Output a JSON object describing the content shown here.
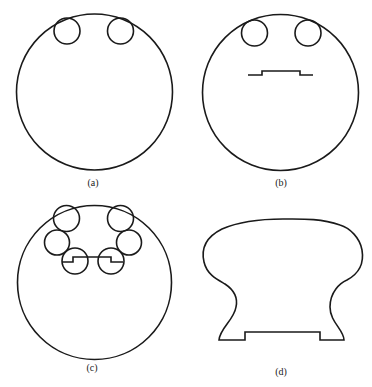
{
  "figure": {
    "panels": [
      {
        "id": "a",
        "label": "(a)",
        "description": "Large circle with two small circles inscribed at top"
      },
      {
        "id": "b",
        "label": "(b)",
        "description": "Large circle with two small circles at top and a stepped line segment below them"
      },
      {
        "id": "c",
        "label": "(c)",
        "description": "Large circle with six small circles arranged in a U shape connected by a stepped line"
      },
      {
        "id": "d",
        "label": "(d)",
        "description": "Resulting profile outline: bulbous top, narrow waist, flat base with rectangular notch"
      }
    ],
    "colors": {
      "stroke": "#1a1a1a",
      "background": "#ffffff"
    }
  }
}
